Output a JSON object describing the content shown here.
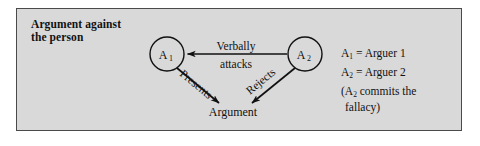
{
  "figure": {
    "title_lines": [
      "Argument against",
      "the person"
    ],
    "panel_bg": "#d9d9d9",
    "panel_border": "#4a4a4a",
    "ink": "#111111"
  },
  "diagram": {
    "nodes": [
      {
        "id": "a1",
        "base": "A",
        "sub": "1",
        "cx": 150,
        "cy": 45,
        "r": 17
      },
      {
        "id": "a2",
        "base": "A",
        "sub": "2",
        "cx": 288,
        "cy": 45,
        "r": 17
      }
    ],
    "target": {
      "id": "argument",
      "label": "Argument",
      "x": 216,
      "y": 103
    },
    "edges": [
      {
        "id": "verbally-attacks",
        "from": "a2",
        "to": "a1",
        "label_lines": [
          "Verbally",
          "attacks"
        ],
        "label_above": "Verbally",
        "label_below": "attacks",
        "direction": "leftward"
      },
      {
        "id": "presents",
        "from": "a1",
        "to": "argument",
        "label": "Presents",
        "direction": "down-right"
      },
      {
        "id": "rejects",
        "from": "a2",
        "to": "argument",
        "label": "Rejects",
        "direction": "down-left"
      }
    ]
  },
  "legend": {
    "rows": [
      {
        "base": "A",
        "sub": "1",
        "text": " = Arguer 1"
      },
      {
        "base": "A",
        "sub": "2",
        "text": " = Arguer 2"
      }
    ],
    "note_open": "(A",
    "note_sub": "2",
    "note_rest": " commits the",
    "note_second_line": "fallacy)"
  }
}
